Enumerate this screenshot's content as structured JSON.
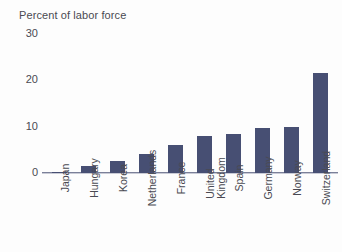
{
  "chart_data": {
    "type": "bar",
    "title": "Percent of labor force",
    "xlabel": "",
    "ylabel": "",
    "ylim": [
      0,
      30
    ],
    "yticks": [
      0,
      10,
      20,
      30
    ],
    "ytick_labels": [
      "0",
      "10",
      "20",
      "30"
    ],
    "grid": false,
    "legend": "none",
    "bar_color": "#474f73",
    "axis_color": "#7b8099",
    "text_color": "#4a4a52",
    "categories": [
      "Japan",
      "Hungary",
      "Korea",
      "Netherlands",
      "France",
      "United\nKingdom",
      "Spain",
      "Germany",
      "Norway",
      "Switzerland"
    ],
    "values": [
      0.3,
      1.5,
      2.5,
      4.0,
      6.0,
      8.0,
      8.5,
      9.7,
      9.9,
      21.5
    ]
  }
}
